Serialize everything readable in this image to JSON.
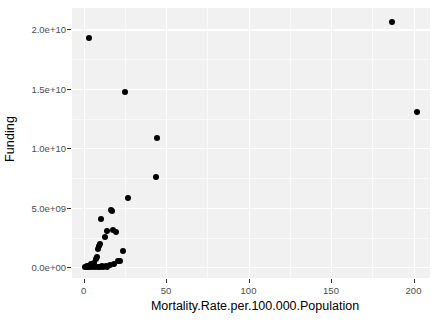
{
  "chart_data": {
    "type": "scatter",
    "title": "",
    "xlabel": "Mortality.Rate.per.100.000.Population",
    "ylabel": "Funding",
    "xlim": [
      -7,
      210
    ],
    "ylim": [
      -900000000,
      21800000000
    ],
    "x_ticks": [
      0,
      50,
      100,
      150,
      200
    ],
    "x_tick_labels": [
      "0",
      "50",
      "100",
      "150",
      "200"
    ],
    "y_ticks": [
      0,
      5000000000,
      10000000000,
      15000000000,
      20000000000
    ],
    "y_tick_labels": [
      "0.0e+00",
      "5.0e+09",
      "1.0e+10",
      "1.5e+10",
      "2.0e+10"
    ],
    "grid": true,
    "legend": "none",
    "point_color": "#000000",
    "panel_color": "#f1f1f1",
    "gridline_color": "#ffffff",
    "points": [
      {
        "x": 187.0,
        "y": 20600000000
      },
      {
        "x": 3.5,
        "y": 19300000000
      },
      {
        "x": 202.0,
        "y": 13050000000
      },
      {
        "x": 25.0,
        "y": 14700000000
      },
      {
        "x": 44.5,
        "y": 10850000000
      },
      {
        "x": 44.0,
        "y": 7600000000
      },
      {
        "x": 27.0,
        "y": 5850000000
      },
      {
        "x": 17.5,
        "y": 4700000000
      },
      {
        "x": 16.5,
        "y": 4800000000
      },
      {
        "x": 10.5,
        "y": 4050000000
      },
      {
        "x": 14.5,
        "y": 3050000000
      },
      {
        "x": 18.0,
        "y": 3100000000
      },
      {
        "x": 19.5,
        "y": 2950000000
      },
      {
        "x": 13.0,
        "y": 2550000000
      },
      {
        "x": 10.0,
        "y": 1950000000
      },
      {
        "x": 9.5,
        "y": 1800000000
      },
      {
        "x": 9.0,
        "y": 1550000000
      },
      {
        "x": 24.0,
        "y": 1400000000
      },
      {
        "x": 8.0,
        "y": 900000000
      },
      {
        "x": 7.5,
        "y": 700000000
      },
      {
        "x": 21.0,
        "y": 550000000
      },
      {
        "x": 22.0,
        "y": 500000000
      },
      {
        "x": 6.5,
        "y": 380000000
      },
      {
        "x": 5.5,
        "y": 300000000
      },
      {
        "x": 4.5,
        "y": 250000000
      },
      {
        "x": 18.5,
        "y": 250000000
      },
      {
        "x": 16.0,
        "y": 170000000
      },
      {
        "x": 3.0,
        "y": 150000000
      },
      {
        "x": 2.0,
        "y": 110000000
      },
      {
        "x": 13.5,
        "y": 100000000
      },
      {
        "x": 11.0,
        "y": 80000000
      },
      {
        "x": 9.0,
        "y": 60000000
      },
      {
        "x": 7.0,
        "y": 50000000
      },
      {
        "x": 5.0,
        "y": 40000000
      },
      {
        "x": 3.5,
        "y": 30000000
      },
      {
        "x": 2.5,
        "y": 20000000
      },
      {
        "x": 1.5,
        "y": 10000000
      },
      {
        "x": 0.8,
        "y": 5000000
      },
      {
        "x": 12.0,
        "y": 30000000
      },
      {
        "x": 14.5,
        "y": 60000000
      },
      {
        "x": 10.0,
        "y": 20000000
      }
    ]
  }
}
